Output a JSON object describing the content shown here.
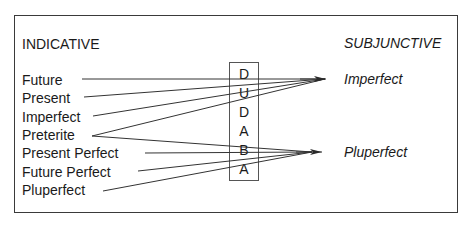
{
  "diagram": {
    "left_heading": "INDICATIVE",
    "right_heading": "SUBJUNCTIVE",
    "indicative_tenses": [
      "Future",
      "Present",
      "Imperfect",
      "Preterite",
      "Present Perfect",
      "Future Perfect",
      "Pluperfect"
    ],
    "subjunctive_tenses": [
      "Imperfect",
      "Pluperfect"
    ],
    "mnemonic_letters": [
      "D",
      "U",
      "D",
      "A",
      "B",
      "A"
    ],
    "mappings": [
      {
        "from": "Future",
        "to": "Imperfect"
      },
      {
        "from": "Present",
        "to": "Imperfect"
      },
      {
        "from": "Imperfect",
        "to": "Imperfect"
      },
      {
        "from": "Preterite",
        "to": "Imperfect"
      },
      {
        "from": "Preterite",
        "to": "Pluperfect"
      },
      {
        "from": "Present Perfect",
        "to": "Pluperfect"
      },
      {
        "from": "Future Perfect",
        "to": "Pluperfect"
      },
      {
        "from": "Pluperfect",
        "to": "Pluperfect"
      }
    ]
  }
}
